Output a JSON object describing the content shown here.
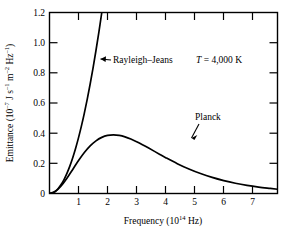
{
  "chart_data": {
    "type": "line",
    "title": "",
    "xlabel": "Frequency (10^14 Hz)",
    "xlabel_main": "Frequency (10",
    "xlabel_exp": "14",
    "xlabel_tail": " Hz)",
    "ylabel": "Emittance (10^-7 J s^-1 m^-2 Hz^-1)",
    "ylabel_parts": {
      "p1": "Emittance (10",
      "e1": "–7",
      "p2": " J s",
      "e2": "–1",
      "p3": " m",
      "e3": "–2",
      "p4": " Hz",
      "e4": "–1",
      "p5": ")"
    },
    "xlim": [
      0,
      7.85
    ],
    "ylim": [
      0,
      1.2
    ],
    "xticks": [
      1,
      2,
      3,
      4,
      5,
      6,
      7
    ],
    "xticklabels": [
      "1",
      "2",
      "3",
      "4",
      "5",
      "6",
      "7"
    ],
    "yticks": [
      0,
      0.2,
      0.4,
      0.6,
      0.8,
      1.0,
      1.2
    ],
    "yticklabels": [
      "0",
      "0.2",
      "0.4",
      "0.6",
      "0.8",
      "1.0",
      "1.2"
    ],
    "grid": false,
    "legend_position": "inline-annotations",
    "frame": "box",
    "tick_direction": "in",
    "line_color": "#000000",
    "background_color": "#ffffff",
    "annotations": [
      {
        "name": "rayleigh-jeans-label",
        "text": "Rayleigh–Jeans",
        "x": 2.05,
        "y": 0.885,
        "arrow_to_x": 1.5,
        "arrow_to_y": 0.845
      },
      {
        "name": "temperature-label",
        "text_italic": "T",
        "text": " = 4,000 K",
        "x": 4.6,
        "y": 0.885
      },
      {
        "name": "planck-label",
        "text": "Planck",
        "x": 5.05,
        "y": 0.415,
        "arrow_to_x": 4.62,
        "arrow_to_y": 0.235
      }
    ],
    "series": [
      {
        "name": "Rayleigh–Jeans",
        "label": "Rayleigh–Jeans",
        "color": "#000000",
        "linewidth": 1.7,
        "x": [
          0.0,
          0.1,
          0.2,
          0.3,
          0.4,
          0.5,
          0.6,
          0.7,
          0.8,
          0.9,
          1.0,
          1.1,
          1.2,
          1.3,
          1.4,
          1.5,
          1.6,
          1.7,
          1.8,
          1.82
        ],
        "y": [
          0.0,
          0.0037,
          0.0148,
          0.0333,
          0.0593,
          0.0926,
          0.1333,
          0.1815,
          0.237,
          0.3,
          0.3704,
          0.4481,
          0.5333,
          0.6259,
          0.7259,
          0.8333,
          0.9481,
          1.0704,
          1.2,
          1.2267
        ]
      },
      {
        "name": "Planck",
        "label": "Planck",
        "color": "#000000",
        "linewidth": 1.7,
        "x": [
          0.0,
          0.2,
          0.4,
          0.6,
          0.8,
          1.0,
          1.2,
          1.4,
          1.6,
          1.8,
          2.0,
          2.2,
          2.4,
          2.6,
          2.8,
          3.0,
          3.2,
          3.4,
          3.6,
          3.8,
          4.0,
          4.4,
          4.8,
          5.2,
          5.6,
          6.0,
          6.4,
          6.8,
          7.2,
          7.6,
          7.85
        ],
        "y": [
          0.0,
          0.0135,
          0.0497,
          0.1012,
          0.1597,
          0.2182,
          0.2713,
          0.3155,
          0.3492,
          0.3722,
          0.3852,
          0.3891,
          0.3855,
          0.3758,
          0.3615,
          0.3438,
          0.3239,
          0.3027,
          0.281,
          0.2592,
          0.2378,
          0.1979,
          0.1626,
          0.1323,
          0.1067,
          0.0855,
          0.0681,
          0.054,
          0.0426,
          0.0335,
          0.0281
        ]
      }
    ],
    "peak": {
      "series": "Planck",
      "x": 2.22,
      "y": 0.389
    }
  }
}
